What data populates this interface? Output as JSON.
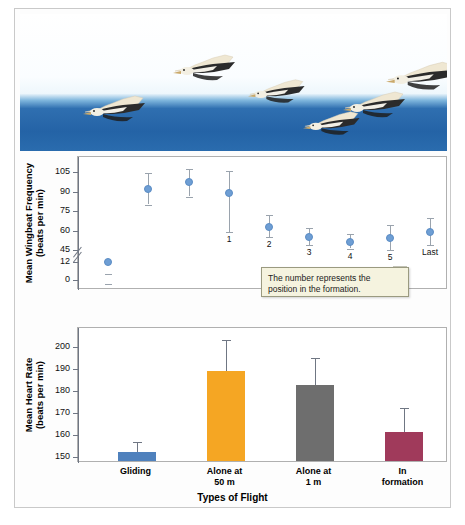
{
  "figure": {
    "photo_alt": "pelicans-flying-in-formation-over-ocean"
  },
  "callout": {
    "text": "The number represents the position in the formation."
  },
  "chart_data": [
    {
      "type": "scatter",
      "title": "",
      "xlabel": "",
      "ylabel": "Mean Wingbeat Frequency (beats per min)",
      "ylabel_line1": "Mean Wingbeat Frequency",
      "ylabel_line2": "(beats per min)",
      "ylim": [
        0,
        112
      ],
      "yticks": [
        0,
        12,
        45,
        60,
        75,
        90,
        105
      ],
      "ytick_labels": [
        "0",
        "12",
        "45",
        "60",
        "75",
        "90",
        "105"
      ],
      "axis_break_between": [
        12,
        45
      ],
      "grid": false,
      "legend": "none",
      "point_labels": [
        "",
        "",
        "1",
        "2",
        "3",
        "4",
        "5",
        "Last"
      ],
      "categories": [
        "Gliding",
        "Alone at 50 m",
        "1",
        "2",
        "3",
        "4",
        "5",
        "Last"
      ],
      "values": [
        12,
        92,
        97,
        89,
        63,
        55,
        51,
        54,
        59
      ],
      "points": [
        {
          "label": "",
          "x": 0,
          "y": 12,
          "err_low": 8,
          "err_high": 7
        },
        {
          "label": "",
          "x": 1,
          "y": 92,
          "err_low": 12,
          "err_high": 12
        },
        {
          "label": "",
          "x": 2,
          "y": 97,
          "err_low": 11,
          "err_high": 10
        },
        {
          "label": "1",
          "x": 3,
          "y": 89,
          "err_low": 30,
          "err_high": 17
        },
        {
          "label": "2",
          "x": 4,
          "y": 63,
          "err_low": 8,
          "err_high": 9
        },
        {
          "label": "3",
          "x": 5,
          "y": 55,
          "err_low": 6,
          "err_high": 7
        },
        {
          "label": "4",
          "x": 6,
          "y": 51,
          "err_low": 5,
          "err_high": 6
        },
        {
          "label": "5",
          "x": 7,
          "y": 54,
          "err_low": 9,
          "err_high": 10
        },
        {
          "label": "Last",
          "x": 8,
          "y": 59,
          "err_low": 10,
          "err_high": 11
        }
      ]
    },
    {
      "type": "bar",
      "title": "",
      "xlabel": "Types of Flight",
      "ylabel": "Mean Heart Rate (beats per min)",
      "ylabel_line1": "Mean Heart Rate",
      "ylabel_line2": "(beats per min)",
      "ylim": [
        148,
        205
      ],
      "yticks": [
        150,
        160,
        170,
        180,
        190,
        200
      ],
      "ytick_labels": [
        "150",
        "160",
        "170",
        "180",
        "190",
        "200"
      ],
      "grid": false,
      "legend": "none",
      "categories": [
        "Gliding",
        "Alone at 50 m",
        "Alone at 1 m",
        "In formation"
      ],
      "category_lines": [
        [
          "Gliding"
        ],
        [
          "Alone at",
          "50 m"
        ],
        [
          "Alone at",
          "1 m"
        ],
        [
          "In",
          "formation"
        ]
      ],
      "values": [
        152,
        189,
        182.5,
        161
      ],
      "err_high": [
        4.5,
        14,
        12.5,
        11
      ],
      "colors": [
        "#4f81bd",
        "#f5a623",
        "#6e6e6e",
        "#a03a5b"
      ]
    }
  ]
}
